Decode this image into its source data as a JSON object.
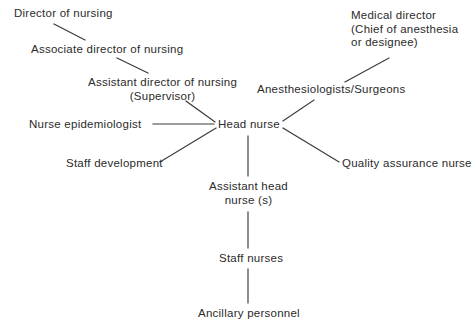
{
  "diagram": {
    "type": "organizational-chart",
    "background_color": "#ffffff",
    "text_color": "#2b2b2b",
    "line_color": "#3a3a3a",
    "nodes": [
      {
        "id": "director-of-nursing",
        "label": "Director of nursing",
        "lines": [
          "Director of nursing"
        ],
        "x": 14,
        "y": 7,
        "align": "left"
      },
      {
        "id": "associate-director-of-nursing",
        "label": "Associate director of nursing",
        "lines": [
          "Associate director of nursing"
        ],
        "x": 31,
        "y": 43,
        "align": "left"
      },
      {
        "id": "assistant-director-of-nursing",
        "label": "Assistant director of nursing (Supervisor)",
        "lines": [
          "Assistant director of nursing",
          "(Supervisor)"
        ],
        "x": 88,
        "y": 76,
        "align": "center"
      },
      {
        "id": "medical-director",
        "label": "Medical director (Chief of anesthesia or designee)",
        "lines": [
          "Medical director",
          "(Chief of anesthesia",
          "or designee)"
        ],
        "x": 351,
        "y": 9,
        "align": "left"
      },
      {
        "id": "anesthesiologists-surgeons",
        "label": "Anesthesiologists/Surgeons",
        "lines": [
          "Anesthesiologists/Surgeons"
        ],
        "x": 257,
        "y": 83,
        "align": "left"
      },
      {
        "id": "nurse-epidemiologist",
        "label": "Nurse epidemiologist",
        "lines": [
          "Nurse epidemiologist"
        ],
        "x": 29,
        "y": 118,
        "align": "left"
      },
      {
        "id": "head-nurse",
        "label": "Head nurse",
        "lines": [
          "Head nurse"
        ],
        "x": 218,
        "y": 118,
        "align": "left"
      },
      {
        "id": "quality-assurance-nurse",
        "label": "Quality assurance nurse",
        "lines": [
          "Quality assurance nurse"
        ],
        "x": 342,
        "y": 157,
        "align": "left"
      },
      {
        "id": "staff-development",
        "label": "Staff development",
        "lines": [
          "Staff development"
        ],
        "x": 66,
        "y": 157,
        "align": "left"
      },
      {
        "id": "assistant-head-nurses",
        "label": "Assistant head nurse (s)",
        "lines": [
          "Assistant head",
          "nurse (s)"
        ],
        "x": 209,
        "y": 180,
        "align": "center"
      },
      {
        "id": "staff-nurses",
        "label": "Staff nurses",
        "lines": [
          "Staff nurses"
        ],
        "x": 219,
        "y": 252,
        "align": "left"
      },
      {
        "id": "ancillary-personnel",
        "label": "Ancillary personnel",
        "lines": [
          "Ancillary personnel"
        ],
        "x": 198,
        "y": 307,
        "align": "left"
      }
    ],
    "edges": [
      {
        "id": "edge-director-to-associate",
        "from": "director-of-nursing",
        "to": "associate-director-of-nursing",
        "x1": 54,
        "y1": 24,
        "x2": 85,
        "y2": 40,
        "style": "diagonal"
      },
      {
        "id": "edge-associate-to-assistant",
        "from": "associate-director-of-nursing",
        "to": "assistant-director-of-nursing",
        "x1": 117,
        "y1": 58,
        "x2": 148,
        "y2": 73,
        "style": "diagonal"
      },
      {
        "id": "edge-assistant-to-head-nurse",
        "from": "assistant-director-of-nursing",
        "to": "head-nurse",
        "x1": 186,
        "y1": 101,
        "x2": 215,
        "y2": 122,
        "style": "diagonal"
      },
      {
        "id": "edge-medical-director-to-anesthesiologists",
        "from": "medical-director",
        "to": "anesthesiologists-surgeons",
        "x1": 389,
        "y1": 58,
        "x2": 345,
        "y2": 82,
        "style": "diagonal"
      },
      {
        "id": "edge-anesthesiologists-to-head-nurse",
        "from": "anesthesiologists-surgeons",
        "to": "head-nurse",
        "x1": 314,
        "y1": 100,
        "x2": 283,
        "y2": 121,
        "style": "diagonal"
      },
      {
        "id": "edge-epidemiologist-to-head-nurse",
        "from": "nurse-epidemiologist",
        "to": "head-nurse",
        "x1": 153,
        "y1": 124,
        "x2": 214,
        "y2": 124,
        "style": "horizontal"
      },
      {
        "id": "edge-staff-development-to-head-nurse",
        "from": "staff-development",
        "to": "head-nurse",
        "x1": 160,
        "y1": 162,
        "x2": 216,
        "y2": 128,
        "style": "diagonal"
      },
      {
        "id": "edge-head-nurse-to-quality-assurance",
        "from": "head-nurse",
        "to": "quality-assurance-nurse",
        "x1": 283,
        "y1": 128,
        "x2": 339,
        "y2": 162,
        "style": "diagonal"
      },
      {
        "id": "edge-head-nurse-to-assistant-head-nurses",
        "from": "head-nurse",
        "to": "assistant-head-nurses",
        "x1": 248,
        "y1": 136,
        "x2": 248,
        "y2": 176,
        "style": "vertical"
      },
      {
        "id": "edge-assistant-head-nurses-to-staff-nurses",
        "from": "assistant-head-nurses",
        "to": "staff-nurses",
        "x1": 248,
        "y1": 212,
        "x2": 248,
        "y2": 248,
        "style": "vertical"
      },
      {
        "id": "edge-staff-nurses-to-ancillary",
        "from": "staff-nurses",
        "to": "ancillary-personnel",
        "x1": 248,
        "y1": 269,
        "x2": 248,
        "y2": 303,
        "style": "vertical"
      }
    ]
  }
}
